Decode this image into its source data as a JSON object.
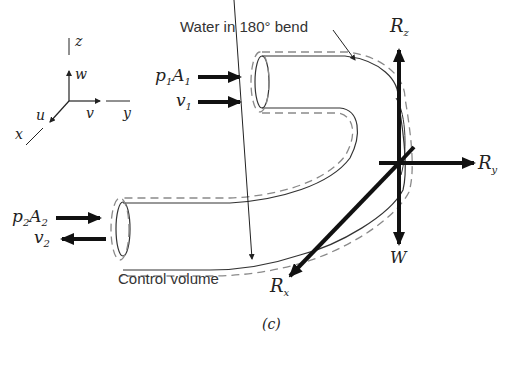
{
  "figure": {
    "caption": "(c)",
    "annotations": {
      "bend_label": "Water in 180° bend",
      "control_volume_label": "Control volume"
    },
    "axes": {
      "z": "z",
      "w": "w",
      "y": "y",
      "v": "v",
      "x": "x",
      "u": "u"
    },
    "inlet": {
      "force_main": "p",
      "force_sub1": "1",
      "force_area": "A",
      "force_sub2": "1",
      "velocity_main": "v",
      "velocity_sub": "1"
    },
    "outlet": {
      "force_main": "p",
      "force_sub1": "2",
      "force_area": "A",
      "force_sub2": "2",
      "velocity_main": "v",
      "velocity_sub": "2"
    },
    "reactions": {
      "Rz_main": "R",
      "Rz_sub": "z",
      "Ry_main": "R",
      "Ry_sub": "y",
      "Rx_main": "R",
      "Rx_sub": "x",
      "weight": "W"
    },
    "colors": {
      "ink": "#111111",
      "pipe": "#333333",
      "control_volume": "#8a8a8a",
      "text": "#333333"
    }
  }
}
